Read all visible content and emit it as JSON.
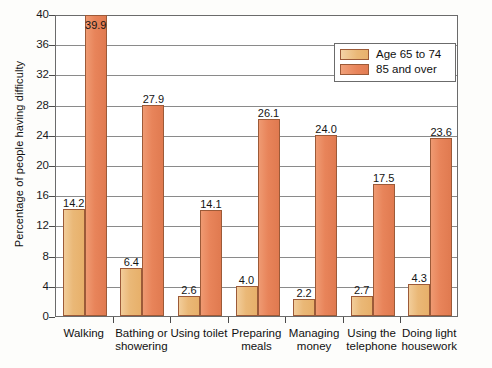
{
  "chart_data": {
    "type": "bar",
    "title": "",
    "xlabel": "",
    "ylabel": "Percentage of people having difficulty",
    "ylim": [
      0,
      40
    ],
    "yticks": [
      0,
      4,
      8,
      12,
      16,
      20,
      24,
      28,
      32,
      36,
      40
    ],
    "grid": true,
    "legend_position": "top-right",
    "categories": [
      "Walking",
      "Bathing or showering",
      "Using toilet",
      "Preparing meals",
      "Managing money",
      "Using the telephone",
      "Doing light housework"
    ],
    "category_lines": [
      [
        "Walking"
      ],
      [
        "Bathing or",
        "showering"
      ],
      [
        "Using toilet"
      ],
      [
        "Preparing",
        "meals"
      ],
      [
        "Managing",
        "money"
      ],
      [
        "Using the",
        "telephone"
      ],
      [
        "Doing light",
        "housework"
      ]
    ],
    "series": [
      {
        "name": "Age 65 to 74",
        "color": "#eab877",
        "values": [
          14.2,
          6.4,
          2.6,
          4.0,
          2.2,
          2.7,
          4.3
        ],
        "labels": [
          "14.2",
          "6.4",
          "2.6",
          "4.0",
          "2.2",
          "2.7",
          "4.3"
        ]
      },
      {
        "name": "85 and over",
        "color": "#e8845a",
        "values": [
          39.9,
          27.9,
          14.1,
          26.1,
          24.0,
          17.5,
          23.6
        ],
        "labels": [
          "39.9",
          "27.9",
          "14.1",
          "26.1",
          "24.0",
          "17.5",
          "23.6"
        ]
      }
    ]
  },
  "legend": {
    "items": [
      {
        "label": "Age 65 to 74",
        "color": "#eab877"
      },
      {
        "label": "85 and over",
        "color": "#e8845a"
      }
    ]
  },
  "axis": {
    "y_title": "Percentage of people having difficulty",
    "y_tick_labels": [
      "0",
      "4",
      "8",
      "12",
      "16",
      "20",
      "24",
      "28",
      "32",
      "36",
      "40"
    ]
  }
}
